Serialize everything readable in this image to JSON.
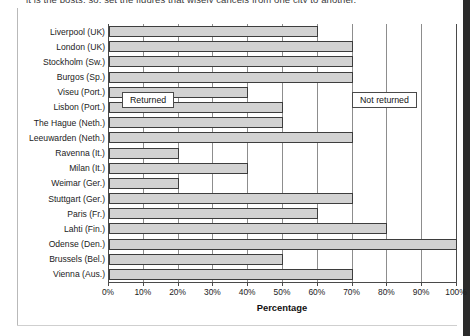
{
  "page": {
    "cutoff_caption": "it is the posts, so, set the figures that wisely cancels from one city to another.",
    "right_band_color": "#2b2b2b"
  },
  "chart_data": {
    "type": "bar",
    "orientation": "horizontal",
    "stacked": true,
    "title": "",
    "xlabel": "Percentage",
    "ylabel": "",
    "xlim": [
      0,
      100
    ],
    "grid": true,
    "legend_position": "floating-inside-plot",
    "categories": [
      "Liverpool (UK)",
      "London (UK)",
      "Stockholm (Sw.)",
      "Burgos (Sp.)",
      "Viseu (Port.)",
      "Lisbon (Port.)",
      "The Hague (Neth.)",
      "Leeuwarden (Neth.)",
      "Ravenna (It.)",
      "Milan (It.)",
      "Weimar (Ger.)",
      "Stuttgart (Ger.)",
      "Paris (Fr.)",
      "Lahti (Fin.)",
      "Odense (Den.)",
      "Brussels (Bel.)",
      "Vienna (Aus.)"
    ],
    "series": [
      {
        "name": "Returned",
        "color": "#d2d2d2",
        "values": [
          60,
          70,
          70,
          70,
          40,
          50,
          50,
          70,
          20,
          40,
          20,
          70,
          60,
          80,
          100,
          50,
          70
        ]
      },
      {
        "name": "Not returned",
        "color": "#ffffff",
        "values": [
          40,
          30,
          30,
          30,
          60,
          50,
          50,
          30,
          80,
          60,
          80,
          30,
          40,
          20,
          0,
          50,
          30
        ]
      }
    ],
    "xticks": [
      0,
      10,
      20,
      30,
      40,
      50,
      60,
      70,
      80,
      90,
      100
    ],
    "xticklabels": [
      "0%",
      "10%",
      "20%",
      "30%",
      "40%",
      "50%",
      "60%",
      "70%",
      "80%",
      "90%",
      "100%"
    ],
    "annotations": [
      {
        "text": "Returned",
        "x_pct": 4,
        "row_index": 4
      },
      {
        "text": "Not returned",
        "x_pct": 70,
        "row_index": 4
      }
    ]
  }
}
